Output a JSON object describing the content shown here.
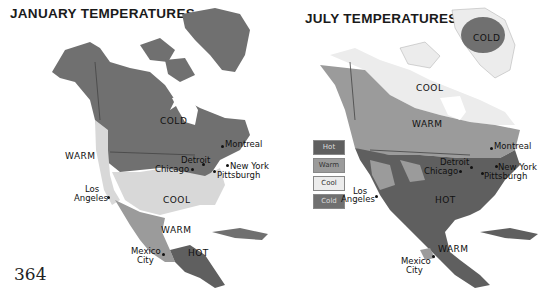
{
  "page_number": "364",
  "colors": {
    "hot": "#5f5f5f",
    "warm": "#9b9b9b",
    "cool": "#d8d8d8",
    "cold": "#707070",
    "water": "#ffffff",
    "border": "#444444"
  },
  "january_map": {
    "title": "JANUARY TEMPERATURES",
    "zones": [
      "COLD",
      "WARM",
      "COOL",
      "WARM",
      "HOT"
    ],
    "cities": {
      "montreal": "Montreal",
      "detroit": "Detroit",
      "chicago": "Chicago",
      "new_york": "New York",
      "pittsburgh": "Pittsburgh",
      "los_angeles_1": "Los",
      "los_angeles_2": "Angeles",
      "mexico_city_1": "Mexico",
      "mexico_city_2": "City"
    }
  },
  "july_map": {
    "title": "JULY TEMPERATURES",
    "zones": [
      "COLD",
      "COOL",
      "WARM",
      "HOT",
      "WARM"
    ],
    "cities": {
      "montreal": "Montreal",
      "detroit": "Detroit",
      "chicago": "Chicago",
      "new_york": "New York",
      "pittsburgh": "Pittsburgh",
      "los_angeles_1": "Los",
      "los_angeles_2": "Angeles",
      "mexico_city_1": "Mexico",
      "mexico_city_2": "City"
    }
  },
  "legend": {
    "items": [
      {
        "label": "Hot",
        "color": "#5f5f5f"
      },
      {
        "label": "Warm",
        "color": "#9b9b9b"
      },
      {
        "label": "Cool",
        "color": "#ececec"
      },
      {
        "label": "Cold",
        "color": "#707070"
      }
    ]
  }
}
